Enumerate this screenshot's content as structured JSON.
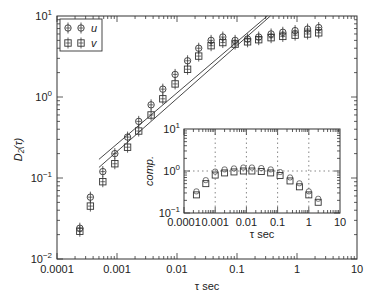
{
  "chart_data": [
    {
      "type": "scatter",
      "title": "",
      "xlabel": "τ sec",
      "ylabel": "D2(τ)",
      "xscale": "log",
      "yscale": "log",
      "xlim": [
        0.0001,
        10
      ],
      "ylim": [
        0.01,
        10
      ],
      "x_ticks": [
        "0.0001",
        "0.001",
        "0.01",
        "0.1",
        "1",
        "10"
      ],
      "y_ticks": [
        "10^-2",
        "10^-1",
        "10^0",
        "10^1"
      ],
      "legend": {
        "position": "upper left",
        "entries": [
          "u",
          "v"
        ]
      },
      "grid": false,
      "x": [
        0.00024,
        0.00036,
        0.00058,
        0.00092,
        0.0015,
        0.0023,
        0.0037,
        0.0058,
        0.0093,
        0.015,
        0.023,
        0.037,
        0.058,
        0.093,
        0.15,
        0.23,
        0.37,
        0.58,
        0.93,
        1.5,
        2.3
      ],
      "series": [
        {
          "name": "u",
          "values": [
            0.024,
            0.058,
            0.12,
            0.2,
            0.32,
            0.5,
            0.8,
            1.25,
            1.9,
            2.8,
            4.0,
            5.0,
            5.5,
            5.0,
            5.2,
            5.5,
            6.0,
            6.3,
            6.6,
            6.9,
            7.2
          ]
        },
        {
          "name": "v",
          "values": [
            0.022,
            0.045,
            0.09,
            0.15,
            0.24,
            0.38,
            0.6,
            0.95,
            1.45,
            2.2,
            3.2,
            4.3,
            4.7,
            4.5,
            4.8,
            5.1,
            5.4,
            5.6,
            5.8,
            6.0,
            6.2
          ]
        }
      ],
      "fit_lines": [
        {
          "name": "u-fit",
          "from": [
            0.0005,
            0.17
          ],
          "to": [
            0.32,
            10
          ]
        },
        {
          "name": "v-fit",
          "from": [
            0.0005,
            0.135
          ],
          "to": [
            0.36,
            10
          ]
        }
      ]
    },
    {
      "type": "scatter",
      "title": "",
      "xlabel": "τ sec",
      "ylabel": "comp.",
      "xscale": "log",
      "yscale": "log",
      "xlim": [
        0.0001,
        10
      ],
      "ylim": [
        0.1,
        10
      ],
      "x_ticks": [
        "0.0001",
        "0.001",
        "0.01",
        "0.1",
        "1",
        "10"
      ],
      "y_ticks": [
        "10^-1",
        "10^0",
        "10^1"
      ],
      "grid": "dotted at decades",
      "x": [
        0.00025,
        0.0005,
        0.001,
        0.002,
        0.004,
        0.008,
        0.015,
        0.03,
        0.06,
        0.12,
        0.25,
        0.5,
        1.0,
        2.0
      ],
      "values": [
        0.27,
        0.5,
        0.8,
        0.9,
        0.95,
        1.0,
        1.0,
        0.97,
        0.9,
        0.78,
        0.58,
        0.42,
        0.27,
        0.18
      ]
    }
  ],
  "main": {
    "ylabel": "D₂(τ)",
    "xlabel": "τ sec",
    "xticks": [
      "0.0001",
      "0.001",
      "0.01",
      "0.1",
      "1",
      "10"
    ],
    "yticks": [
      {
        "b": "10",
        "e": "1"
      },
      {
        "b": "10",
        "e": "0"
      },
      {
        "b": "10",
        "e": "−1"
      },
      {
        "b": "10",
        "e": "−2"
      }
    ],
    "legend": [
      {
        "label": "u",
        "marker": "circle-cross"
      },
      {
        "label": "v",
        "marker": "square-cross"
      }
    ]
  },
  "inset": {
    "ylabel": "comp.",
    "xlabel": "τ sec",
    "xticks": [
      "0.0001",
      "0.001",
      "0.01",
      "0.1",
      "1",
      "10"
    ],
    "yticks": [
      {
        "b": "10",
        "e": "1"
      },
      {
        "b": "10",
        "e": "0"
      },
      {
        "b": "10",
        "e": "−1"
      }
    ]
  }
}
